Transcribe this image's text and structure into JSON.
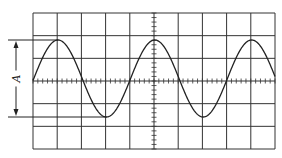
{
  "diagram": {
    "grid": {
      "left": 33,
      "top": 13,
      "right": 275,
      "bottom": 149,
      "columns": 10,
      "rows": 6,
      "minor_ticks_per_division": 5,
      "line_color": "#333333"
    },
    "waveform": {
      "type": "sine",
      "peak_y": 40,
      "trough_y": 117,
      "center_y": 81,
      "period_divisions": 4,
      "first_peak_x": 58,
      "color": "#222222"
    },
    "amplitude_marker": {
      "label": "A",
      "x": 16,
      "top_y": 40,
      "bottom_y": 117
    }
  }
}
